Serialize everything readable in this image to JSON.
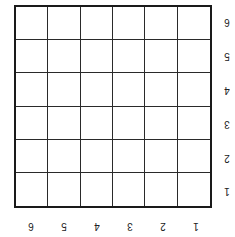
{
  "grid": {
    "rows": 6,
    "cols": 6,
    "orientation": "rotated-180",
    "row_labels": [
      "6",
      "5",
      "4",
      "3",
      "2",
      "1"
    ],
    "col_labels": [
      "6",
      "5",
      "4",
      "3",
      "2",
      "1"
    ],
    "line_color": "#1a1a1a",
    "background": "#ffffff"
  }
}
